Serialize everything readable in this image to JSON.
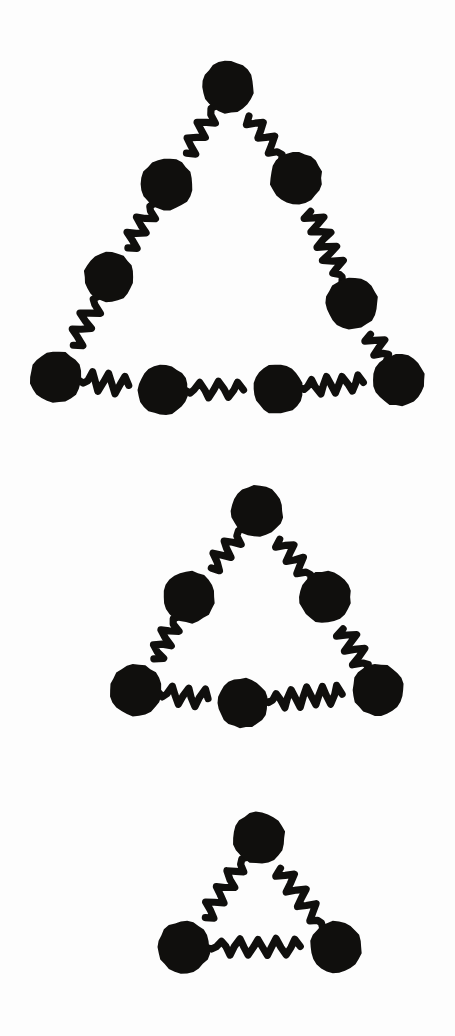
{
  "figure": {
    "background_color": "#fdfdfd",
    "ink_color": "#100f0d",
    "canvas": {
      "width": 455,
      "height": 1036
    },
    "node_shape": "filled-circle",
    "link_shape": "wavy-squiggle",
    "link_stroke_width": 7.2,
    "caption": ""
  },
  "groups": [
    {
      "id": "assembly-large",
      "label": "Large triangular assembly",
      "node_count": 9,
      "link_count": 9,
      "node_radius": 26,
      "nodes": [
        {
          "id": "L-apex",
          "label": "apex node",
          "cx": 228,
          "cy": 87,
          "r": 26
        },
        {
          "id": "L-left-1",
          "label": "upper left node",
          "cx": 167,
          "cy": 184,
          "r": 26
        },
        {
          "id": "L-left-2",
          "label": "lower left node",
          "cx": 109,
          "cy": 277,
          "r": 25
        },
        {
          "id": "L-bot-1",
          "label": "bottom node one",
          "cx": 56,
          "cy": 377,
          "r": 26
        },
        {
          "id": "L-bot-2",
          "label": "bottom node two",
          "cx": 163,
          "cy": 390,
          "r": 25
        },
        {
          "id": "L-bot-3",
          "label": "bottom node three",
          "cx": 278,
          "cy": 389,
          "r": 25
        },
        {
          "id": "L-bot-4",
          "label": "bottom node four",
          "cx": 399,
          "cy": 380,
          "r": 26
        },
        {
          "id": "L-right-2",
          "label": "lower right node",
          "cx": 352,
          "cy": 303,
          "r": 26
        },
        {
          "id": "L-right-1",
          "label": "upper right node",
          "cx": 296,
          "cy": 178,
          "r": 26
        }
      ],
      "links": [
        {
          "id": "L-link-1",
          "from": "L-apex",
          "to": "L-left-1",
          "style": "wavy"
        },
        {
          "id": "L-link-2",
          "from": "L-left-1",
          "to": "L-left-2",
          "style": "wavy"
        },
        {
          "id": "L-link-3",
          "from": "L-left-2",
          "to": "L-bot-1",
          "style": "wavy"
        },
        {
          "id": "L-link-4",
          "from": "L-bot-1",
          "to": "L-bot-2",
          "style": "wavy"
        },
        {
          "id": "L-link-5",
          "from": "L-bot-2",
          "to": "L-bot-3",
          "style": "wavy"
        },
        {
          "id": "L-link-6",
          "from": "L-bot-3",
          "to": "L-bot-4",
          "style": "wavy"
        },
        {
          "id": "L-link-7",
          "from": "L-bot-4",
          "to": "L-right-2",
          "style": "wavy"
        },
        {
          "id": "L-link-8",
          "from": "L-right-2",
          "to": "L-right-1",
          "style": "wavy"
        },
        {
          "id": "L-link-9",
          "from": "L-right-1",
          "to": "L-apex",
          "style": "wavy"
        }
      ]
    },
    {
      "id": "assembly-medium",
      "label": "Medium triangular assembly",
      "node_count": 6,
      "link_count": 6,
      "node_radius": 26,
      "nodes": [
        {
          "id": "M-apex",
          "label": "apex node",
          "cx": 257,
          "cy": 511,
          "r": 26
        },
        {
          "id": "M-left",
          "label": "left node",
          "cx": 189,
          "cy": 597,
          "r": 26
        },
        {
          "id": "M-bot-1",
          "label": "bottom left node",
          "cx": 136,
          "cy": 690,
          "r": 26
        },
        {
          "id": "M-bot-2",
          "label": "bottom middle node",
          "cx": 243,
          "cy": 703,
          "r": 25
        },
        {
          "id": "M-bot-3",
          "label": "bottom right node",
          "cx": 378,
          "cy": 690,
          "r": 26
        },
        {
          "id": "M-right",
          "label": "right node",
          "cx": 325,
          "cy": 597,
          "r": 26
        }
      ],
      "links": [
        {
          "id": "M-link-1",
          "from": "M-apex",
          "to": "M-left",
          "style": "wavy"
        },
        {
          "id": "M-link-2",
          "from": "M-left",
          "to": "M-bot-1",
          "style": "wavy"
        },
        {
          "id": "M-link-3",
          "from": "M-bot-1",
          "to": "M-bot-2",
          "style": "wavy"
        },
        {
          "id": "M-link-4",
          "from": "M-bot-2",
          "to": "M-bot-3",
          "style": "wavy"
        },
        {
          "id": "M-link-5",
          "from": "M-bot-3",
          "to": "M-right",
          "style": "wavy"
        },
        {
          "id": "M-link-6",
          "from": "M-right",
          "to": "M-apex",
          "style": "wavy"
        }
      ]
    },
    {
      "id": "assembly-small",
      "label": "Small triangular assembly",
      "node_count": 3,
      "link_count": 3,
      "node_radius": 26,
      "nodes": [
        {
          "id": "S-apex",
          "label": "apex node",
          "cx": 259,
          "cy": 838,
          "r": 26
        },
        {
          "id": "S-left",
          "label": "bottom left node",
          "cx": 184,
          "cy": 947,
          "r": 26
        },
        {
          "id": "S-right",
          "label": "bottom right node",
          "cx": 336,
          "cy": 947,
          "r": 26
        }
      ],
      "links": [
        {
          "id": "S-link-1",
          "from": "S-apex",
          "to": "S-left",
          "style": "wavy"
        },
        {
          "id": "S-link-2",
          "from": "S-left",
          "to": "S-right",
          "style": "wavy"
        },
        {
          "id": "S-link-3",
          "from": "S-right",
          "to": "S-apex",
          "style": "wavy"
        }
      ]
    }
  ]
}
